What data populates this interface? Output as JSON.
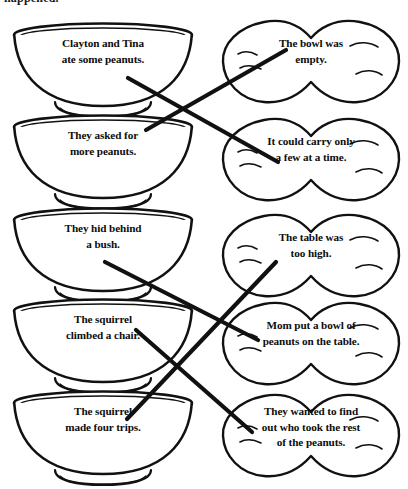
{
  "worksheet": {
    "heading_clipped": "happened.",
    "type": "matching-activity",
    "instructions_visible": false
  },
  "left_column": {
    "shape": "bowl",
    "items": [
      {
        "id": "bowl-1",
        "text": "Clayton and Tina ate some peanuts.",
        "lines": [
          "Clayton and Tina",
          "ate some peanuts."
        ]
      },
      {
        "id": "bowl-2",
        "text": "They asked for more peanuts.",
        "lines": [
          "They asked for",
          "more peanuts."
        ]
      },
      {
        "id": "bowl-3",
        "text": "They hid behind a bush.",
        "lines": [
          "They hid behind",
          "a bush."
        ]
      },
      {
        "id": "bowl-4",
        "text": "The squirrel climbed a chair.",
        "lines": [
          "The squirrel",
          "climbed a chair."
        ]
      },
      {
        "id": "bowl-5",
        "text": "The squirrel made four trips.",
        "lines": [
          "The squirrel",
          "made four trips."
        ]
      }
    ]
  },
  "right_column": {
    "shape": "peanut",
    "items": [
      {
        "id": "nut-1",
        "text": "The bowl was empty.",
        "lines": [
          "The bowl was",
          "empty."
        ]
      },
      {
        "id": "nut-2",
        "text": "It could carry only a few at a time.",
        "lines": [
          "It could carry only",
          "a few at a time."
        ]
      },
      {
        "id": "nut-3",
        "text": "The table was too high.",
        "lines": [
          "The table was",
          "too high."
        ]
      },
      {
        "id": "nut-4",
        "text": "Mom put a bowl of peanuts on the table.",
        "lines": [
          "Mom put a bowl of",
          "peanuts on the table."
        ]
      },
      {
        "id": "nut-5",
        "text": "They wanted to find out who took the rest of the peanuts.",
        "lines": [
          "They wanted to find",
          "out who took the rest",
          "of the peanuts."
        ]
      }
    ]
  },
  "connections": [
    {
      "from": "bowl-1",
      "to": "nut-2"
    },
    {
      "from": "bowl-2",
      "to": "nut-1"
    },
    {
      "from": "bowl-3",
      "to": "nut-4"
    },
    {
      "from": "bowl-4",
      "to": "nut-5"
    },
    {
      "from": "bowl-5",
      "to": "nut-3"
    }
  ],
  "style": {
    "ink": "#111111",
    "paper": "#ffffff",
    "line_width_px": 4
  }
}
